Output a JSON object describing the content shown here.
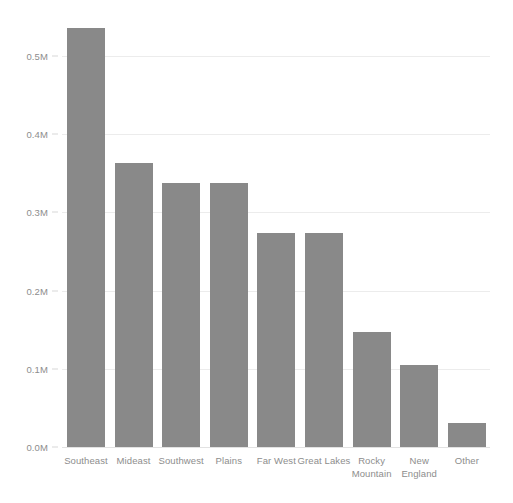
{
  "chart_data": {
    "type": "bar",
    "title": "",
    "subtitle": "",
    "xlabel": "",
    "ylabel": "",
    "categories": [
      "Southeast",
      "Mideast",
      "Southwest",
      "Plains",
      "Far West",
      "Great Lakes",
      "Rocky Mountain",
      "New England",
      "Other"
    ],
    "category_lines": [
      [
        "Southeast"
      ],
      [
        "Mideast"
      ],
      [
        "Southwest"
      ],
      [
        "Plains"
      ],
      [
        "Far West"
      ],
      [
        "Great Lakes"
      ],
      [
        "Rocky",
        "Mountain"
      ],
      [
        "New",
        "England"
      ],
      [
        "Other"
      ]
    ],
    "values": [
      0.536,
      0.363,
      0.338,
      0.337,
      0.274,
      0.274,
      0.147,
      0.105,
      0.031
    ],
    "value_unit": "M",
    "ylim": [
      0.0,
      0.55
    ],
    "yticks": [
      0.0,
      0.1,
      0.2,
      0.3,
      0.4,
      0.5
    ],
    "ytick_labels": [
      "0.0M",
      "0.1M",
      "0.2M",
      "0.3M",
      "0.4M",
      "0.5M"
    ],
    "grid": true,
    "grid_axis": "y",
    "legend": false,
    "legend_position": "none",
    "bar_color": "#898989",
    "grid_color": "#ececec",
    "axis_text_color": "#8d8d8d",
    "background_color": "#ffffff"
  }
}
